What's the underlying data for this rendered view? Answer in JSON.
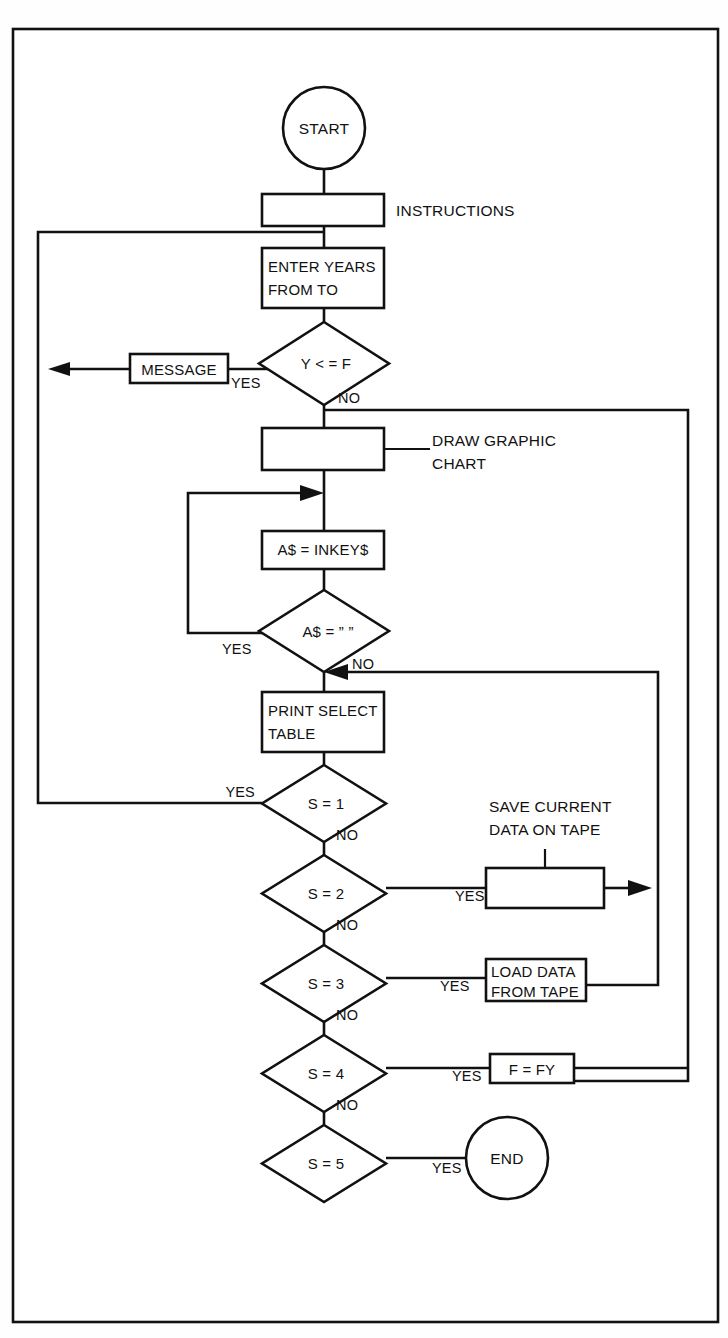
{
  "diagram": {
    "type": "flowchart",
    "border_color": "#111111",
    "background": "#ffffff",
    "nodes": {
      "start": {
        "shape": "terminator",
        "label": "START"
      },
      "instructions": {
        "shape": "process",
        "label": "",
        "annotation": "INSTRUCTIONS"
      },
      "enter_years": {
        "shape": "process",
        "line1": "ENTER YEARS",
        "line2": "FROM TO"
      },
      "check_years": {
        "shape": "decision",
        "label": "Y < = F"
      },
      "message": {
        "shape": "process",
        "label": "MESSAGE"
      },
      "draw_chart": {
        "shape": "process",
        "label": "",
        "annotation_line1": "DRAW GRAPHIC",
        "annotation_line2": "CHART"
      },
      "inkey": {
        "shape": "process",
        "label": "A$ = INKEY$"
      },
      "check_key": {
        "shape": "decision",
        "label": "A$ = ” ”"
      },
      "print_select": {
        "shape": "process",
        "line1": "PRINT SELECT",
        "line2": "TABLE"
      },
      "s1": {
        "shape": "decision",
        "label": "S = 1"
      },
      "s2": {
        "shape": "decision",
        "label": "S = 2"
      },
      "save_tape": {
        "shape": "process",
        "label": "",
        "annotation_line1": "SAVE CURRENT",
        "annotation_line2": "DATA ON TAPE"
      },
      "s3": {
        "shape": "decision",
        "label": "S = 3"
      },
      "load_tape": {
        "shape": "process",
        "line1": "LOAD DATA",
        "line2": "FROM TAPE"
      },
      "s4": {
        "shape": "decision",
        "label": "S = 4"
      },
      "f_fy": {
        "shape": "process",
        "label": "F = FY"
      },
      "s5": {
        "shape": "decision",
        "label": "S = 5"
      },
      "end": {
        "shape": "terminator",
        "label": "END"
      }
    },
    "edge_labels": {
      "yes": "YES",
      "no": "NO"
    },
    "branches": [
      {
        "from": "check_years",
        "label": "YES",
        "to": "message"
      },
      {
        "from": "check_years",
        "label": "NO",
        "to": "draw_chart"
      },
      {
        "from": "check_key",
        "label": "YES",
        "to": "inkey"
      },
      {
        "from": "check_key",
        "label": "NO",
        "to": "print_select"
      },
      {
        "from": "s1",
        "label": "YES",
        "to": "enter_years"
      },
      {
        "from": "s1",
        "label": "NO",
        "to": "s2"
      },
      {
        "from": "s2",
        "label": "YES",
        "to": "save_tape"
      },
      {
        "from": "s2",
        "label": "NO",
        "to": "s3"
      },
      {
        "from": "s3",
        "label": "YES",
        "to": "load_tape"
      },
      {
        "from": "s3",
        "label": "NO",
        "to": "s4"
      },
      {
        "from": "s4",
        "label": "YES",
        "to": "f_fy"
      },
      {
        "from": "s4",
        "label": "NO",
        "to": "s5"
      },
      {
        "from": "s5",
        "label": "YES",
        "to": "end"
      }
    ]
  }
}
